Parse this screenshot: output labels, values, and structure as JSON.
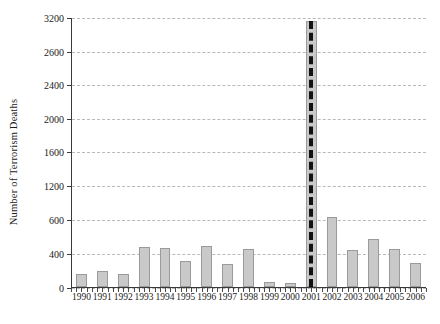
{
  "chart_data": {
    "type": "bar",
    "title": "",
    "xlabel": "",
    "ylabel": "Number of Terrorism Deaths",
    "categories": [
      "1990",
      "1991",
      "1992",
      "1993",
      "1994",
      "1995",
      "1996",
      "1997",
      "1998",
      "1999",
      "2000",
      "2001",
      "2002",
      "2003",
      "2004",
      "2005",
      "2006"
    ],
    "values": [
      150,
      195,
      150,
      470,
      465,
      305,
      490,
      270,
      450,
      55,
      50,
      3150,
      825,
      440,
      570,
      450,
      290
    ],
    "ytick_labels": [
      "0",
      "400",
      "600",
      "1200",
      "1600",
      "2000",
      "2400",
      "2600",
      "3200"
    ],
    "ytick_positions_px": [
      270,
      236,
      202,
      168,
      134,
      101,
      67,
      34,
      0
    ],
    "ylim": [
      0,
      3200
    ],
    "grid": "horizontal-dashed",
    "legend": "none",
    "annotations": [
      {
        "name": "marker-2001",
        "kind": "vertical-dashed-line",
        "at_category": "2001",
        "color": "#111111"
      }
    ],
    "bar_fill_color": "#c9c9c9",
    "bar_border_color": "#9a9a9a",
    "gridline_color": "#b9b9b9",
    "axis_color": "#3a3a3a"
  }
}
